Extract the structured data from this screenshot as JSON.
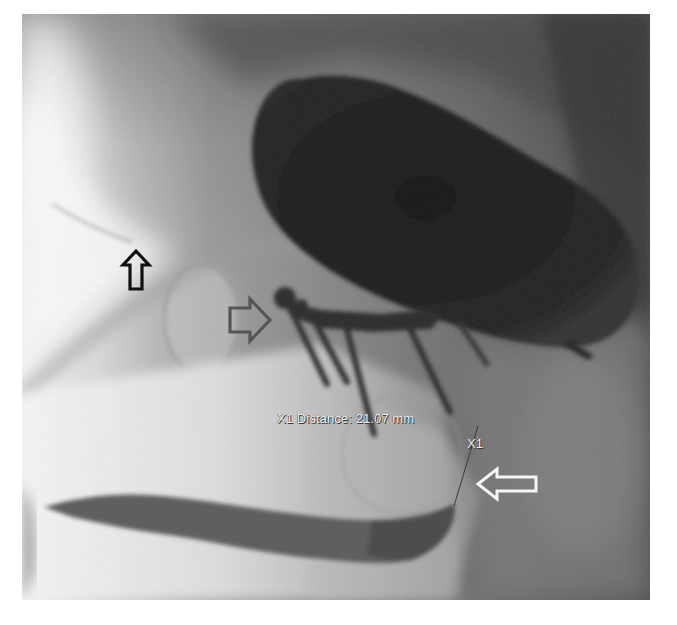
{
  "image": {
    "description": "Fluoroscopic / X-ray image of the pelvis with contrast-filled balloon, screws and contrast tract",
    "background_color": "#ffffff"
  },
  "annotations": {
    "measurement": {
      "label": "X1 Distance: 21.07 mm",
      "marker_id": "X1",
      "value": "21.07",
      "unit": "mm"
    },
    "arrows": [
      {
        "name": "black-up-arrow",
        "direction": "up",
        "color": "#111111",
        "style": "outline"
      },
      {
        "name": "gray-right-arrow",
        "direction": "right",
        "color": "#555555",
        "style": "outline"
      },
      {
        "name": "white-left-arrow",
        "direction": "left",
        "color": "#f5f5f5",
        "style": "outline"
      }
    ]
  },
  "colors": {
    "dark_balloon": "#1c1c1c",
    "soft_tissue": "#8a8a8a",
    "bright_bone": "#eeeeee",
    "overlay_text": "#f2f2f2"
  }
}
